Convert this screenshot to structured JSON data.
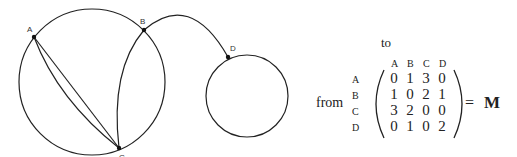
{
  "graph": {
    "nodes": [
      {
        "id": "A",
        "label": "A"
      },
      {
        "id": "B",
        "label": "B"
      },
      {
        "id": "C",
        "label": "C"
      },
      {
        "id": "D",
        "label": "D"
      }
    ],
    "edges": [
      {
        "from": "A",
        "to": "B",
        "count": 1
      },
      {
        "from": "A",
        "to": "C",
        "count": 3
      },
      {
        "from": "B",
        "to": "C",
        "count": 2
      },
      {
        "from": "B",
        "to": "D",
        "count": 1
      },
      {
        "from": "D",
        "to": "D",
        "count": 1,
        "type": "loop"
      }
    ]
  },
  "matrix": {
    "to_label": "to",
    "from_label": "from",
    "col_headers": [
      "A",
      "B",
      "C",
      "D"
    ],
    "row_headers": [
      "A",
      "B",
      "C",
      "D"
    ],
    "rows": [
      [
        "0",
        "1",
        "3",
        "0"
      ],
      [
        "1",
        "0",
        "2",
        "1"
      ],
      [
        "3",
        "2",
        "0",
        "0"
      ],
      [
        "0",
        "1",
        "0",
        "2"
      ]
    ],
    "equals": "=",
    "name": "M"
  }
}
